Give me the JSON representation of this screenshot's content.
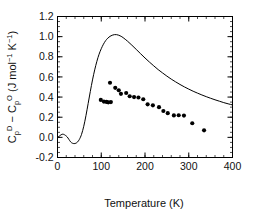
{
  "chart_data": {
    "type": "line",
    "title": "",
    "subtitle": "",
    "xlabel": "Temperature (K)",
    "ylabel": "Cp^D - Cp^O (J mol^-1 K^-1)",
    "ylabel_parts": {
      "c1": "C",
      "c1_sub": "p",
      "c1_sup": "D",
      "minus": " − ",
      "c2": "C",
      "c2_sub": "p",
      "c2_sup": "O",
      "units_open": " (J mol",
      "units_sup1": "−1",
      "units_mid": " K",
      "units_sup2": "−1",
      "units_close": ")"
    },
    "xlim": [
      0,
      400
    ],
    "ylim": [
      -0.2,
      1.2
    ],
    "xticks": [
      0,
      100,
      200,
      300,
      400
    ],
    "xticklabels": [
      "0",
      "100",
      "200",
      "300",
      "400"
    ],
    "yticks": [
      -0.2,
      0.0,
      0.2,
      0.4,
      0.6,
      0.8,
      1.0,
      1.2
    ],
    "yticklabels": [
      "-0.2",
      "0.0",
      "0.2",
      "0.4",
      "0.6",
      "0.8",
      "1.0",
      "1.2"
    ],
    "x_minor_interval": 20,
    "y_minor_interval": 0.05,
    "grid": false,
    "legend": "none",
    "frame": true,
    "series": [
      {
        "name": "model curve",
        "type": "line",
        "color": "#000000",
        "linewidth": 1.0,
        "x": [
          0,
          5,
          10,
          14,
          18,
          22,
          26,
          30,
          34,
          38,
          42,
          46,
          50,
          55,
          60,
          65,
          70,
          75,
          80,
          85,
          90,
          95,
          100,
          105,
          110,
          115,
          120,
          125,
          130,
          135,
          140,
          145,
          150,
          160,
          170,
          180,
          190,
          200,
          210,
          220,
          230,
          240,
          250,
          260,
          270,
          280,
          290,
          300,
          310,
          320,
          330,
          340,
          350,
          360,
          370,
          380,
          390,
          400
        ],
        "y": [
          0.0,
          0.015,
          0.03,
          0.03,
          0.02,
          0.005,
          -0.02,
          -0.045,
          -0.058,
          -0.062,
          -0.058,
          -0.045,
          -0.02,
          0.03,
          0.11,
          0.215,
          0.335,
          0.455,
          0.57,
          0.67,
          0.755,
          0.825,
          0.88,
          0.925,
          0.96,
          0.985,
          1.003,
          1.014,
          1.02,
          1.02,
          1.014,
          1.004,
          0.99,
          0.955,
          0.915,
          0.873,
          0.83,
          0.788,
          0.748,
          0.71,
          0.673,
          0.64,
          0.608,
          0.578,
          0.551,
          0.525,
          0.501,
          0.479,
          0.458,
          0.439,
          0.421,
          0.404,
          0.388,
          0.373,
          0.359,
          0.345,
          0.333,
          0.322
        ]
      },
      {
        "name": "experimental points",
        "type": "scatter",
        "marker": "filled-circle",
        "color": "#000000",
        "markersize": 3.0,
        "x": [
          99,
          106,
          112,
          116,
          120,
          122,
          132,
          140,
          145,
          157,
          165,
          175,
          185,
          196,
          206,
          218,
          232,
          242,
          252,
          266,
          277,
          289,
          308,
          335
        ],
        "y": [
          0.372,
          0.355,
          0.352,
          0.348,
          0.542,
          0.35,
          0.492,
          0.468,
          0.432,
          0.44,
          0.408,
          0.4,
          0.396,
          0.378,
          0.328,
          0.318,
          0.3,
          0.262,
          0.24,
          0.218,
          0.22,
          0.216,
          0.14,
          0.07
        ]
      }
    ]
  },
  "figure": {
    "background_color": "#ffffff",
    "axis_color": "#000000",
    "text_color": "#111111"
  }
}
